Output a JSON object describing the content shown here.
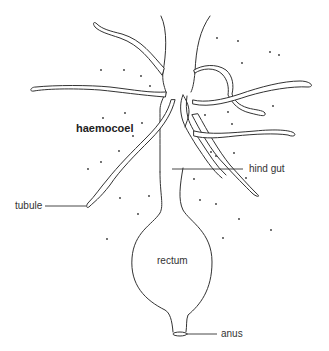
{
  "diagram": {
    "title_label": "haemocoel",
    "labels": {
      "hind_gut": "hind gut",
      "tubule": "tubule",
      "rectum": "rectum",
      "anus": "anus",
      "haemocoel": "haemocoel"
    },
    "colors": {
      "stroke": "#333333",
      "background": "#ffffff",
      "text": "#333333"
    }
  }
}
